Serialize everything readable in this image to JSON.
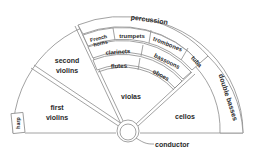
{
  "diagram": {
    "sections": {
      "percussion": "percussion",
      "french_horns_line1": "French",
      "french_horns_line2": "horns",
      "trumpets": "trumpets",
      "trombones": "trombones",
      "tuba": "tuba",
      "clarinets": "clarinets",
      "bassoons": "bassoons",
      "flutes": "flutes",
      "oboes": "oboes",
      "violas": "violas",
      "second_violins_line1": "second",
      "second_violins_line2": "violins",
      "first_violins_line1": "first",
      "first_violins_line2": "violins",
      "harp": "harp",
      "cellos": "cellos",
      "double_basses": "double basses",
      "conductor": "conductor"
    },
    "colors": {
      "line": "#8a8a8a",
      "text": "#2a2a2a",
      "background": "#ffffff"
    }
  }
}
